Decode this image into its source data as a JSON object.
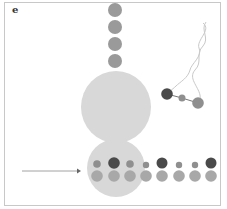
{
  "panel": {
    "label": "e"
  },
  "colors": {
    "ribosome": "#d8d8d8",
    "chain_bead": "#9a9a9a",
    "dark_bead": "#4a4a4a",
    "light_bead": "#a8a8a8",
    "mid_bead": "#8f8f8f",
    "helix": "#c9c9c9",
    "arrow": "#8a8a8a"
  },
  "diagram": {
    "chain_beads": [
      {
        "cx": 115,
        "cy": 10,
        "r": 7
      },
      {
        "cx": 115,
        "cy": 27,
        "r": 7
      },
      {
        "cx": 115,
        "cy": 44,
        "r": 7
      },
      {
        "cx": 115,
        "cy": 61,
        "r": 7
      }
    ],
    "large_subunit": {
      "cx": 116,
      "cy": 107,
      "rx": 35,
      "ry": 36
    },
    "small_subunit": {
      "cx": 116,
      "cy": 168,
      "rx": 29,
      "ry": 29
    },
    "top_row": [
      {
        "cx": 97,
        "cy": 164,
        "r": 3.8,
        "tone": "mid"
      },
      {
        "cx": 114,
        "cy": 163,
        "r": 5.8,
        "tone": "dark"
      },
      {
        "cx": 130,
        "cy": 164,
        "r": 3.8,
        "tone": "mid"
      },
      {
        "cx": 146,
        "cy": 165,
        "r": 3.2,
        "tone": "mid"
      },
      {
        "cx": 162,
        "cy": 163,
        "r": 5.5,
        "tone": "dark"
      },
      {
        "cx": 179,
        "cy": 165,
        "r": 3.2,
        "tone": "mid"
      },
      {
        "cx": 195,
        "cy": 165,
        "r": 3.2,
        "tone": "mid"
      },
      {
        "cx": 211,
        "cy": 163,
        "r": 5.5,
        "tone": "dark"
      }
    ],
    "bottom_row": [
      {
        "cx": 97,
        "cy": 176,
        "r": 5.8
      },
      {
        "cx": 114,
        "cy": 176,
        "r": 5.8
      },
      {
        "cx": 130,
        "cy": 176,
        "r": 5.8
      },
      {
        "cx": 146,
        "cy": 176,
        "r": 5.8
      },
      {
        "cx": 162,
        "cy": 176,
        "r": 5.8
      },
      {
        "cx": 179,
        "cy": 176,
        "r": 5.8
      },
      {
        "cx": 195,
        "cy": 176,
        "r": 5.8
      },
      {
        "cx": 211,
        "cy": 176,
        "r": 5.8
      }
    ],
    "trna_beads": [
      {
        "cx": 167,
        "cy": 94,
        "r": 5.8,
        "tone": "dark"
      },
      {
        "cx": 182,
        "cy": 98,
        "r": 3.5,
        "tone": "mid"
      },
      {
        "cx": 198,
        "cy": 103,
        "r": 5.8,
        "tone": "mid"
      }
    ],
    "arrow": {
      "x1": 22,
      "y1": 171,
      "x2": 81,
      "y2": 171
    }
  }
}
